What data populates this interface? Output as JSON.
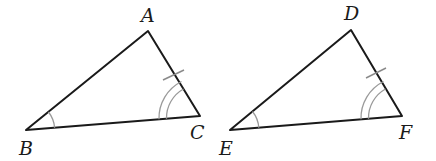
{
  "diagram": {
    "type": "congruent-triangles",
    "colors": {
      "sides": "#1a1a1a",
      "marks": "#9a9a9a",
      "labels": "#1a1a1a"
    },
    "triangles": [
      {
        "name": "ABC",
        "vertices": {
          "A": {
            "label": "A",
            "x": 148,
            "y": 31,
            "label_x": 148,
            "label_y": 22
          },
          "B": {
            "label": "B",
            "x": 26,
            "y": 130,
            "label_x": 28,
            "label_y": 155
          },
          "C": {
            "label": "C",
            "x": 200,
            "y": 116,
            "label_x": 196,
            "label_y": 139
          }
        },
        "marks": {
          "single_arc_angle": "B",
          "double_arc_angle": "C",
          "tick_side": "AC"
        }
      },
      {
        "name": "DEF",
        "vertices": {
          "D": {
            "label": "D",
            "x": 351,
            "y": 30,
            "label_x": 352,
            "label_y": 20
          },
          "E": {
            "label": "E",
            "x": 230,
            "y": 130,
            "label_x": 226,
            "label_y": 155
          },
          "F": {
            "label": "F",
            "x": 402,
            "y": 116,
            "label_x": 405,
            "label_y": 139
          }
        },
        "marks": {
          "single_arc_angle": "E",
          "double_arc_angle": "F",
          "tick_side": "DF"
        }
      }
    ]
  }
}
